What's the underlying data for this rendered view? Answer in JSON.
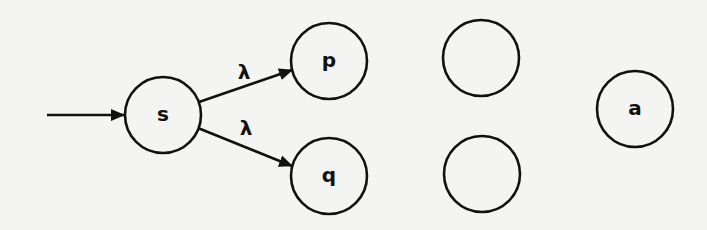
{
  "diagram": {
    "type": "finite-automaton",
    "start_state": "s",
    "states": [
      {
        "id": "s",
        "label": "s",
        "cx": 163,
        "cy": 115,
        "r": 38
      },
      {
        "id": "p",
        "label": "p",
        "cx": 329,
        "cy": 61,
        "r": 38
      },
      {
        "id": "q",
        "label": "q",
        "cx": 329,
        "cy": 176,
        "r": 38
      },
      {
        "id": "u1",
        "label": "",
        "cx": 481,
        "cy": 58,
        "r": 38
      },
      {
        "id": "u2",
        "label": "",
        "cx": 482,
        "cy": 174,
        "r": 38
      },
      {
        "id": "a",
        "label": "a",
        "cx": 635,
        "cy": 109,
        "r": 38
      }
    ],
    "transitions": [
      {
        "from": "s",
        "to": "p",
        "label": "λ"
      },
      {
        "from": "s",
        "to": "q",
        "label": "λ"
      }
    ],
    "start_arrow": {
      "x1": 47,
      "y1": 115,
      "x2": 125,
      "y2": 115
    }
  },
  "labels": {
    "s": "s",
    "p": "p",
    "q": "q",
    "a": "a",
    "edge_sp": "λ",
    "edge_sq": "λ"
  }
}
